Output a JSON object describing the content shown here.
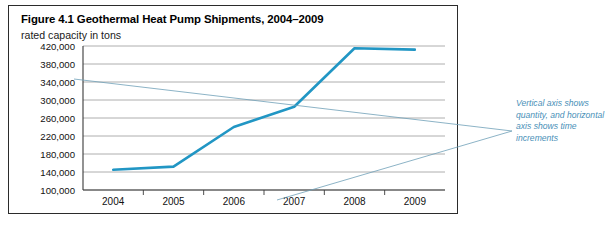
{
  "figure": {
    "title": "Figure 4.1 Geothermal Heat Pump Shipments, 2004–2009",
    "subtitle": "rated capacity in tons"
  },
  "annotation": {
    "text": "Vertical axis shows quantity, and horizontal axis shows time increments"
  },
  "colors": {
    "series_line": "#2196c4",
    "annotation_text": "#4a90b8",
    "leader_line": "#6f9fb8",
    "gridline": "#9a9a9a",
    "axis": "#3a3a3a",
    "border": "#2b2b2b"
  },
  "chart_data": {
    "type": "line",
    "title": "Figure 4.1 Geothermal Heat Pump Shipments, 2004–2009",
    "subtitle": "rated capacity in tons",
    "xlabel": "",
    "ylabel": "rated capacity in tons",
    "categories": [
      "2004",
      "2005",
      "2006",
      "2007",
      "2008",
      "2009"
    ],
    "x": [
      2004,
      2005,
      2006,
      2007,
      2008,
      2009
    ],
    "values": [
      145000,
      152000,
      240000,
      285000,
      415000,
      412000
    ],
    "series": [
      {
        "name": "Geothermal heat pump shipments",
        "values": [
          145000,
          152000,
          240000,
          285000,
          415000,
          412000
        ]
      }
    ],
    "ylim": [
      100000,
      420000
    ],
    "yticks": [
      100000,
      140000,
      180000,
      220000,
      260000,
      300000,
      340000,
      380000,
      420000
    ],
    "ytick_labels": [
      "100,000",
      "140,000",
      "180,000",
      "220,000",
      "260,000",
      "300,000",
      "340,000",
      "380,000",
      "420,000"
    ],
    "xtick_labels": [
      "2004",
      "2005",
      "2006",
      "2007",
      "2008",
      "2009"
    ],
    "grid": true,
    "legend": false,
    "legend_position": "none",
    "annotations": [
      {
        "text": "Vertical axis shows quantity, and horizontal axis shows time increments",
        "position": "right"
      }
    ]
  }
}
